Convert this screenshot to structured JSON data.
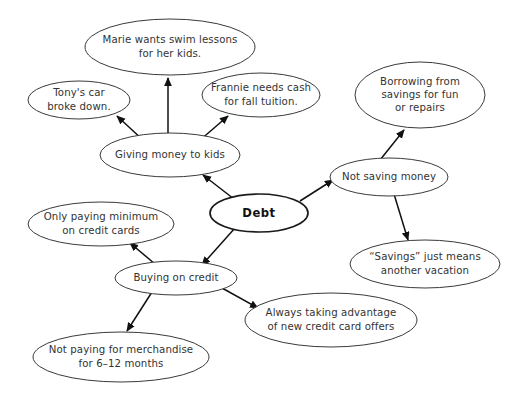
{
  "diagram": {
    "type": "concept-map",
    "canvas": {
      "width": 514,
      "height": 400,
      "background": "#ffffff"
    },
    "colors": {
      "node_fill": "#ffffff",
      "node_stroke": "#3a3a3a",
      "central_node_stroke": "#1a1a1a",
      "edge_stroke": "#111111",
      "text": "#333333",
      "central_text": "#111111"
    },
    "nodes": [
      {
        "id": "debt",
        "label": "Debt",
        "lines": [
          "Debt"
        ],
        "central": true,
        "cx": 259,
        "cy": 213,
        "rx": 49,
        "ry": 19
      },
      {
        "id": "giving-money-to-kids",
        "label": "Giving money to kids",
        "lines": [
          "Giving money to kids"
        ],
        "central": false,
        "cx": 170,
        "cy": 155,
        "rx": 70,
        "ry": 22
      },
      {
        "id": "marie-swim-lessons",
        "label": "Marie wants swim lessons for her kids.",
        "lines": [
          "Marie wants swim lessons",
          "for her kids."
        ],
        "central": false,
        "cx": 170,
        "cy": 47,
        "rx": 85,
        "ry": 28
      },
      {
        "id": "tonys-car",
        "label": "Tony's car broke down.",
        "lines": [
          "Tony's car",
          "broke down."
        ],
        "central": false,
        "cx": 79,
        "cy": 100,
        "rx": 51,
        "ry": 19
      },
      {
        "id": "frannie-tuition",
        "label": "Frannie needs cash for fall tuition.",
        "lines": [
          "Frannie needs cash",
          "for fall tuition."
        ],
        "central": false,
        "cx": 261,
        "cy": 95,
        "rx": 59,
        "ry": 22
      },
      {
        "id": "not-saving-money",
        "label": "Not saving money",
        "lines": [
          "Not saving money"
        ],
        "central": false,
        "cx": 389,
        "cy": 177,
        "rx": 59,
        "ry": 19
      },
      {
        "id": "borrowing-from-savings",
        "label": "Borrowing from savings for fun or repairs",
        "lines": [
          "Borrowing from",
          "savings for fun",
          "or repairs"
        ],
        "central": false,
        "cx": 420,
        "cy": 95,
        "rx": 65,
        "ry": 33
      },
      {
        "id": "savings-means-vacation",
        "label": "\"Savings\" just means another vacation",
        "lines": [
          "“Savings” just means",
          "another vacation"
        ],
        "central": false,
        "cx": 425,
        "cy": 264,
        "rx": 75,
        "ry": 24
      },
      {
        "id": "buying-on-credit",
        "label": "Buying on credit",
        "lines": [
          "Buying on credit"
        ],
        "central": false,
        "cx": 176,
        "cy": 278,
        "rx": 61,
        "ry": 17
      },
      {
        "id": "only-paying-minimum",
        "label": "Only paying minimum on credit cards",
        "lines": [
          "Only paying minimum",
          "on credit cards"
        ],
        "central": false,
        "cx": 101,
        "cy": 224,
        "rx": 73,
        "ry": 22
      },
      {
        "id": "not-paying-merchandise",
        "label": "Not paying for merchandise for 6-12 months",
        "lines": [
          "Not paying for merchandise",
          "for 6–12 months"
        ],
        "central": false,
        "cx": 121,
        "cy": 357,
        "rx": 88,
        "ry": 25
      },
      {
        "id": "credit-card-offers",
        "label": "Always taking advantage of new credit card offers",
        "lines": [
          "Always taking advantage",
          "of new credit card offers"
        ],
        "central": false,
        "cx": 331,
        "cy": 320,
        "rx": 86,
        "ry": 27
      }
    ],
    "edges": [
      {
        "id": "debt-to-giving",
        "from": "debt",
        "to": "giving-money-to-kids",
        "x1": 234,
        "y1": 199,
        "x2": 203,
        "y2": 175,
        "arrow": true
      },
      {
        "id": "debt-to-not-saving",
        "from": "debt",
        "to": "not-saving-money",
        "x1": 300,
        "y1": 201,
        "x2": 333,
        "y2": 180,
        "arrow": true
      },
      {
        "id": "debt-to-buying",
        "from": "debt",
        "to": "buying-on-credit",
        "x1": 235,
        "y1": 228,
        "x2": 202,
        "y2": 265,
        "arrow": true
      },
      {
        "id": "giving-to-marie",
        "from": "giving-money-to-kids",
        "to": "marie-swim-lessons",
        "x1": 168,
        "y1": 135,
        "x2": 168,
        "y2": 78,
        "arrow": true
      },
      {
        "id": "giving-to-tony",
        "from": "giving-money-to-kids",
        "to": "tonys-car",
        "x1": 144,
        "y1": 141,
        "x2": 117,
        "y2": 116,
        "arrow": true
      },
      {
        "id": "giving-to-frannie",
        "from": "giving-money-to-kids",
        "to": "frannie-tuition",
        "x1": 199,
        "y1": 141,
        "x2": 228,
        "y2": 116,
        "arrow": true
      },
      {
        "id": "not-saving-to-borrowing",
        "from": "not-saving-money",
        "to": "borrowing-from-savings",
        "x1": 380,
        "y1": 160,
        "x2": 404,
        "y2": 130,
        "arrow": true
      },
      {
        "id": "not-saving-to-vacation",
        "from": "not-saving-money",
        "to": "savings-means-vacation",
        "x1": 394,
        "y1": 194,
        "x2": 408,
        "y2": 240,
        "arrow": true
      },
      {
        "id": "buying-to-minimum",
        "from": "buying-on-credit",
        "to": "only-paying-minimum",
        "x1": 155,
        "y1": 264,
        "x2": 130,
        "y2": 243,
        "arrow": true
      },
      {
        "id": "buying-to-merchandise",
        "from": "buying-on-credit",
        "to": "not-paying-merchandise",
        "x1": 152,
        "y1": 292,
        "x2": 127,
        "y2": 331,
        "arrow": true
      },
      {
        "id": "buying-to-offers",
        "from": "buying-on-credit",
        "to": "credit-card-offers",
        "x1": 222,
        "y1": 288,
        "x2": 258,
        "y2": 308,
        "arrow": true
      }
    ]
  }
}
